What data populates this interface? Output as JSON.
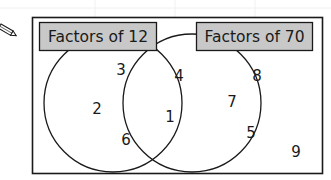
{
  "diagram": {
    "type": "venn",
    "sets": [
      {
        "id": "left",
        "label": "Factors of 12",
        "only_values": [
          "3",
          "2",
          "6"
        ]
      },
      {
        "id": "right",
        "label": "Factors of 70",
        "only_values": [
          "8",
          "7",
          "5"
        ]
      }
    ],
    "intersection_values": [
      "4",
      "1"
    ],
    "outside_values": [
      "9"
    ],
    "label_box_fill": "#c8c8c8",
    "line_color": "#1a1a1a",
    "icon": "pencil-icon"
  }
}
